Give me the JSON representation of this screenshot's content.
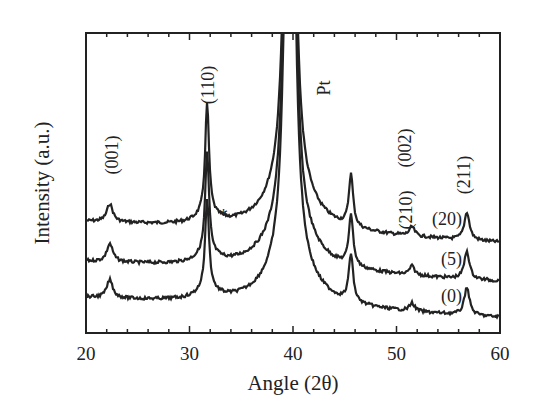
{
  "chart_data": {
    "type": "line",
    "title": "",
    "xlabel": "Angle (2θ)",
    "ylabel": "Intensity (a.u.)",
    "xlim": [
      20,
      60
    ],
    "xticks": [
      20,
      30,
      40,
      50,
      60
    ],
    "ylim": "arbitrary units (offset traces)",
    "grid": false,
    "legend": "inline labels at right",
    "peak_labels": [
      {
        "label": "(001)",
        "x": 22.3
      },
      {
        "label": "(110)",
        "x": 31.7
      },
      {
        "label": "Pt",
        "x": 39.7
      },
      {
        "label": "(002)",
        "x": 45.6
      },
      {
        "label": "(210)",
        "x": 51.5
      },
      {
        "label": "(211)",
        "x": 56.8
      }
    ],
    "annotations": [
      {
        "label": "*",
        "x": 33.0,
        "series": "(20)"
      }
    ],
    "series": [
      {
        "name": "(20)",
        "offset_px": 0,
        "peaks": [
          {
            "x": 22.3,
            "height": 18
          },
          {
            "x": 31.7,
            "height": 110
          },
          {
            "x": 39.7,
            "height": 999
          },
          {
            "x": 45.6,
            "height": 52
          },
          {
            "x": 51.5,
            "height": 9
          },
          {
            "x": 56.8,
            "height": 28
          }
        ]
      },
      {
        "name": "(5)",
        "offset_px": 0,
        "peaks": [
          {
            "x": 22.3,
            "height": 18
          },
          {
            "x": 31.7,
            "height": 100
          },
          {
            "x": 39.7,
            "height": 999
          },
          {
            "x": 45.6,
            "height": 52
          },
          {
            "x": 51.5,
            "height": 9
          },
          {
            "x": 56.8,
            "height": 28
          }
        ]
      },
      {
        "name": "(0)",
        "offset_px": 0,
        "peaks": [
          {
            "x": 22.3,
            "height": 18
          },
          {
            "x": 31.7,
            "height": 90
          },
          {
            "x": 39.7,
            "height": 999
          },
          {
            "x": 45.6,
            "height": 48
          },
          {
            "x": 51.5,
            "height": 8
          },
          {
            "x": 56.8,
            "height": 28
          }
        ]
      }
    ]
  }
}
